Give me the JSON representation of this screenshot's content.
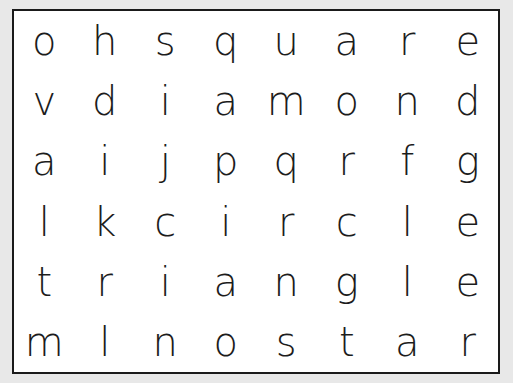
{
  "puzzle": {
    "type": "word-search",
    "rows": 6,
    "columns": 8,
    "background_color": "#e8e8e8",
    "grid_background_color": "#ffffff",
    "border_color": "#1a1a1a",
    "letter_color": "#1c1c1c",
    "grid": [
      [
        "o",
        "h",
        "s",
        "q",
        "u",
        "a",
        "r",
        "e"
      ],
      [
        "v",
        "d",
        "i",
        "a",
        "m",
        "o",
        "n",
        "d"
      ],
      [
        "a",
        "i",
        "j",
        "p",
        "q",
        "r",
        "f",
        "g"
      ],
      [
        "l",
        "k",
        "c",
        "i",
        "r",
        "c",
        "l",
        "e"
      ],
      [
        "t",
        "r",
        "i",
        "a",
        "n",
        "g",
        "l",
        "e"
      ],
      [
        "m",
        "l",
        "n",
        "o",
        "s",
        "t",
        "a",
        "r"
      ]
    ],
    "rows_as_text": [
      "o h s q u a r e",
      "v d i a m o n d",
      "a i j p q r f g",
      "l k c i r c l e",
      "t r i a n g l e",
      "m l n o s t a r"
    ],
    "hidden_words": [
      "square",
      "diamond",
      "circle",
      "triangle",
      "star",
      "oval"
    ]
  }
}
